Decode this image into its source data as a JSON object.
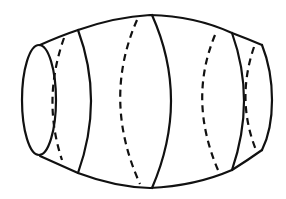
{
  "figure": {
    "stroke_color": "#111111",
    "background": "#ffffff",
    "sections": {
      "solid_count": 4,
      "dashed_count": 4
    }
  }
}
